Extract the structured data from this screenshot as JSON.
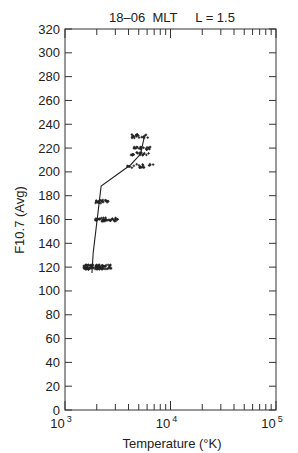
{
  "chart_data": {
    "type": "scatter",
    "title": "18–06  MLT     L = 1.5",
    "xlabel": "Temperature (°K)",
    "ylabel": "F10.7 (Avg)",
    "xscale": "log",
    "xlim": [
      1000,
      100000
    ],
    "ylim": [
      0,
      320
    ],
    "xticks": [
      "10^3",
      "10^4",
      "10^5"
    ],
    "yticks": [
      0,
      20,
      40,
      60,
      80,
      100,
      120,
      140,
      160,
      180,
      200,
      220,
      240,
      260,
      280,
      300,
      320
    ],
    "grid": false,
    "legend": null,
    "series": [
      {
        "name": "observations",
        "type": "scatter",
        "clusters": [
          {
            "f107": 120,
            "temp_range_K": [
              1500,
              2800
            ],
            "approx_center_K": 1900
          },
          {
            "f107": 160,
            "temp_range_K": [
              1900,
              3200
            ],
            "approx_center_K": 2400
          },
          {
            "f107": 175,
            "temp_range_K": [
              1900,
              2600
            ],
            "approx_center_K": 2200
          },
          {
            "f107": 205,
            "temp_range_K": [
              3900,
              7000
            ],
            "approx_center_K": 5000
          },
          {
            "f107": 215,
            "temp_range_K": [
              4200,
              6500
            ],
            "approx_center_K": 5300
          },
          {
            "f107": 220,
            "temp_range_K": [
              4500,
              6500
            ],
            "approx_center_K": 5600
          },
          {
            "f107": 230,
            "temp_range_K": [
              4300,
              6500
            ],
            "approx_center_K": 5300
          }
        ]
      },
      {
        "name": "trend",
        "type": "line",
        "x": [
          1800,
          1850,
          2200,
          4200,
          5200,
          5600
        ],
        "y": [
          115,
          132,
          188,
          206,
          215,
          228
        ]
      }
    ]
  },
  "labels": {
    "title": "18–06  MLT     L = 1.5",
    "xlabel": "Temperature (°K)",
    "ylabel": "F10.7 (Avg)",
    "xtick_base": [
      "10",
      "10",
      "10"
    ],
    "xtick_exp": [
      "3",
      "4",
      "5"
    ],
    "yticks": [
      "0",
      "20",
      "40",
      "60",
      "80",
      "100",
      "120",
      "140",
      "160",
      "180",
      "200",
      "220",
      "240",
      "260",
      "280",
      "300",
      "320"
    ]
  }
}
